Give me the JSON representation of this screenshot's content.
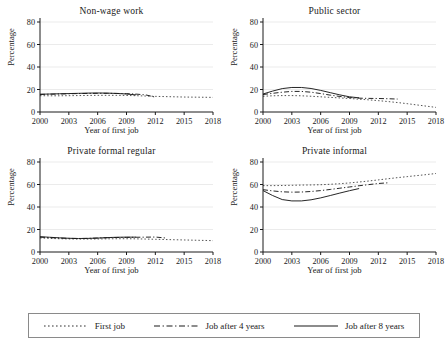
{
  "figure": {
    "xlabel": "Year of first job",
    "ylabel": "Percentage",
    "background": "#ffffff",
    "line_color": "#1a1a1a"
  },
  "legend": {
    "items": [
      {
        "label": "First job",
        "style": "dotted",
        "swatch_name": "legend-swatch-dotted"
      },
      {
        "label": "Job after 4 years",
        "style": "dash-dot",
        "swatch_name": "legend-swatch-dashdot"
      },
      {
        "label": "Job after 8 years",
        "style": "solid",
        "swatch_name": "legend-swatch-solid"
      }
    ]
  },
  "axes": {
    "xticks": [
      "2000",
      "2003",
      "2006",
      "2009",
      "2012",
      "2015",
      "2018"
    ],
    "xtick_values": [
      2000,
      2003,
      2006,
      2009,
      2012,
      2015,
      2018
    ],
    "yticks": [
      "0",
      "20",
      "40",
      "60",
      "80"
    ],
    "ytick_values": [
      0,
      20,
      40,
      60,
      80
    ],
    "xlim": [
      2000,
      2018
    ],
    "ylim": [
      0,
      80
    ]
  },
  "chart_data": [
    {
      "type": "line",
      "title": "Non-wage work",
      "xlabel": "Year of first job",
      "ylabel": "Percentage",
      "xlim": [
        2000,
        2018
      ],
      "ylim": [
        0,
        80
      ],
      "grid": true,
      "legend_position": "figure-bottom",
      "x": [
        2000,
        2001,
        2002,
        2003,
        2004,
        2005,
        2006,
        2007,
        2008,
        2009,
        2010,
        2011,
        2012,
        2013,
        2014,
        2015,
        2016,
        2017,
        2018
      ],
      "series": [
        {
          "name": "First job",
          "style": "dotted",
          "values": [
            14.5,
            14.4,
            14.4,
            14.5,
            14.6,
            14.7,
            14.8,
            14.8,
            14.8,
            14.7,
            14.5,
            14.2,
            13.9,
            13.7,
            13.5,
            13.3,
            13.2,
            13.1,
            13.0
          ]
        },
        {
          "name": "Job after 4 years",
          "style": "dash-dot",
          "values": [
            15.6,
            15.8,
            16.0,
            16.2,
            16.4,
            16.5,
            16.6,
            16.6,
            16.5,
            16.3,
            15.9,
            15.2,
            13.2,
            null,
            null,
            null,
            null,
            null,
            null
          ]
        },
        {
          "name": "Job after 8 years",
          "style": "solid",
          "values": [
            15.8,
            16.0,
            16.2,
            16.4,
            16.6,
            16.8,
            16.9,
            16.8,
            16.5,
            16.0,
            15.2,
            null,
            null,
            null,
            null,
            null,
            null,
            null,
            null
          ]
        }
      ]
    },
    {
      "type": "line",
      "title": "Public sector",
      "xlabel": "Year of first job",
      "ylabel": "Percentage",
      "xlim": [
        2000,
        2018
      ],
      "ylim": [
        0,
        80
      ],
      "grid": true,
      "legend_position": "figure-bottom",
      "x": [
        2000,
        2001,
        2002,
        2003,
        2004,
        2005,
        2006,
        2007,
        2008,
        2009,
        2010,
        2011,
        2012,
        2013,
        2014,
        2015,
        2016,
        2017,
        2018
      ],
      "series": [
        {
          "name": "First job",
          "style": "dotted",
          "values": [
            14.0,
            14.4,
            14.6,
            14.6,
            14.4,
            14.0,
            13.5,
            13.0,
            12.5,
            12.0,
            11.4,
            10.8,
            10.1,
            9.3,
            8.4,
            7.4,
            6.3,
            5.2,
            4.1
          ]
        },
        {
          "name": "Job after 4 years",
          "style": "dash-dot",
          "values": [
            15.5,
            16.6,
            17.6,
            18.3,
            18.3,
            17.6,
            16.4,
            15.0,
            13.8,
            12.8,
            12.3,
            12.1,
            12.0,
            11.8,
            11.5,
            null,
            null,
            null,
            null
          ]
        },
        {
          "name": "Job after 8 years",
          "style": "solid",
          "values": [
            16.0,
            18.6,
            20.8,
            21.8,
            21.8,
            20.9,
            19.2,
            17.2,
            15.2,
            13.5,
            12.6,
            null,
            null,
            null,
            null,
            null,
            null,
            null,
            null
          ]
        }
      ]
    },
    {
      "type": "line",
      "title": "Private formal regular",
      "xlabel": "Year of first job",
      "ylabel": "Percentage",
      "xlim": [
        2000,
        2018
      ],
      "ylim": [
        0,
        80
      ],
      "grid": true,
      "legend_position": "figure-bottom",
      "x": [
        2000,
        2001,
        2002,
        2003,
        2004,
        2005,
        2006,
        2007,
        2008,
        2009,
        2010,
        2011,
        2012,
        2013,
        2014,
        2015,
        2016,
        2017,
        2018
      ],
      "series": [
        {
          "name": "First job",
          "style": "dotted",
          "values": [
            12.5,
            12.1,
            11.8,
            11.6,
            11.5,
            11.5,
            11.6,
            11.7,
            11.8,
            11.8,
            11.7,
            11.5,
            11.3,
            11.1,
            10.9,
            10.7,
            10.5,
            10.3,
            10.1
          ]
        },
        {
          "name": "Job after 4 years",
          "style": "dash-dot",
          "values": [
            13.2,
            12.8,
            12.4,
            12.1,
            12.0,
            12.1,
            12.4,
            12.7,
            12.9,
            13.0,
            13.1,
            13.2,
            13.3,
            12.5,
            null,
            null,
            null,
            null,
            null
          ]
        },
        {
          "name": "Job after 8 years",
          "style": "solid",
          "values": [
            13.6,
            13.1,
            12.6,
            12.2,
            12.0,
            12.1,
            12.4,
            12.8,
            13.1,
            13.2,
            13.2,
            null,
            null,
            null,
            null,
            null,
            null,
            null,
            null
          ]
        }
      ]
    },
    {
      "type": "line",
      "title": "Private informal",
      "xlabel": "Year of first job",
      "ylabel": "Percentage",
      "xlim": [
        2000,
        2018
      ],
      "ylim": [
        0,
        80
      ],
      "grid": true,
      "legend_position": "figure-bottom",
      "x": [
        2000,
        2001,
        2002,
        2003,
        2004,
        2005,
        2006,
        2007,
        2008,
        2009,
        2010,
        2011,
        2012,
        2013,
        2014,
        2015,
        2016,
        2017,
        2018
      ],
      "series": [
        {
          "name": "First job",
          "style": "dotted",
          "values": [
            59.0,
            59.0,
            59.1,
            59.3,
            59.5,
            59.6,
            59.8,
            60.2,
            60.7,
            61.4,
            62.2,
            63.1,
            64.1,
            65.1,
            66.1,
            67.0,
            67.9,
            68.8,
            69.8
          ]
        },
        {
          "name": "Job after 4 years",
          "style": "dash-dot",
          "values": [
            55.4,
            54.3,
            53.5,
            53.2,
            53.3,
            53.8,
            54.6,
            55.6,
            56.7,
            57.8,
            58.9,
            59.9,
            60.9,
            61.5,
            null,
            null,
            null,
            null,
            null
          ]
        },
        {
          "name": "Job after 8 years",
          "style": "solid",
          "values": [
            54.6,
            50.2,
            46.6,
            45.4,
            45.4,
            46.4,
            48.1,
            50.2,
            52.4,
            54.5,
            56.4,
            null,
            null,
            null,
            null,
            null,
            null,
            null,
            null
          ]
        }
      ]
    }
  ]
}
